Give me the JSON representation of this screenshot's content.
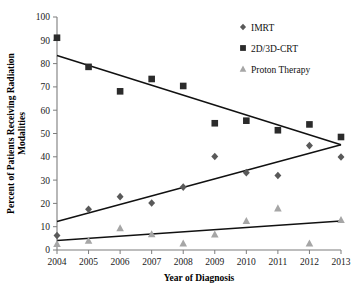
{
  "chart_data": {
    "type": "scatter",
    "title": "",
    "xlabel": "Year of Diagnosis",
    "ylabel": "Percent of Patients Receiving Radiation Modalities",
    "ylabel_line1": "Percent of Patients Receiving Radiation",
    "ylabel_line2": "Modalities",
    "categories": [
      2004,
      2005,
      2006,
      2007,
      2008,
      2009,
      2010,
      2011,
      2012,
      2013
    ],
    "x": [
      2004,
      2005,
      2006,
      2007,
      2008,
      2009,
      2010,
      2011,
      2012,
      2013
    ],
    "xtick_labels": [
      "2004",
      "2005",
      "2006",
      "2007",
      "2008",
      "2009",
      "2010",
      "2011",
      "2012",
      "2013"
    ],
    "ytick_labels": [
      "0",
      "10",
      "20",
      "30",
      "40",
      "50",
      "60",
      "70",
      "80",
      "90",
      "100"
    ],
    "yticks": [
      0,
      10,
      20,
      30,
      40,
      50,
      60,
      70,
      80,
      90,
      100
    ],
    "ylim": [
      0,
      100
    ],
    "xlim": [
      2004,
      2013
    ],
    "grid": false,
    "legend_position": "top-right",
    "series": [
      {
        "name": "IMRT",
        "marker": "diamond",
        "color": "#595959",
        "values": [
          6.2,
          17.5,
          22.9,
          20.2,
          27.0,
          40.1,
          33.2,
          32.0,
          44.8,
          39.9
        ],
        "trendline": {
          "start": 12.2,
          "end": 45.2
        }
      },
      {
        "name": "2D/3D-CRT",
        "marker": "square",
        "color": "#2b2b2b",
        "values": [
          91.1,
          78.6,
          68.1,
          73.4,
          70.4,
          54.4,
          55.5,
          51.4,
          53.9,
          48.5
        ],
        "trendline": {
          "start": 83.5,
          "end": 45.2
        }
      },
      {
        "name": "Proton Therapy",
        "marker": "triangle",
        "color": "#a6a6a6",
        "values": [
          2.6,
          4.0,
          9.4,
          6.8,
          2.8,
          6.7,
          12.5,
          17.9,
          2.8,
          12.9
        ],
        "trendline": {
          "start": 4.1,
          "end": 12.4
        }
      }
    ]
  },
  "legend": {
    "items": [
      {
        "label": "IMRT"
      },
      {
        "label": "2D/3D-CRT"
      },
      {
        "label": "Proton Therapy"
      }
    ]
  }
}
